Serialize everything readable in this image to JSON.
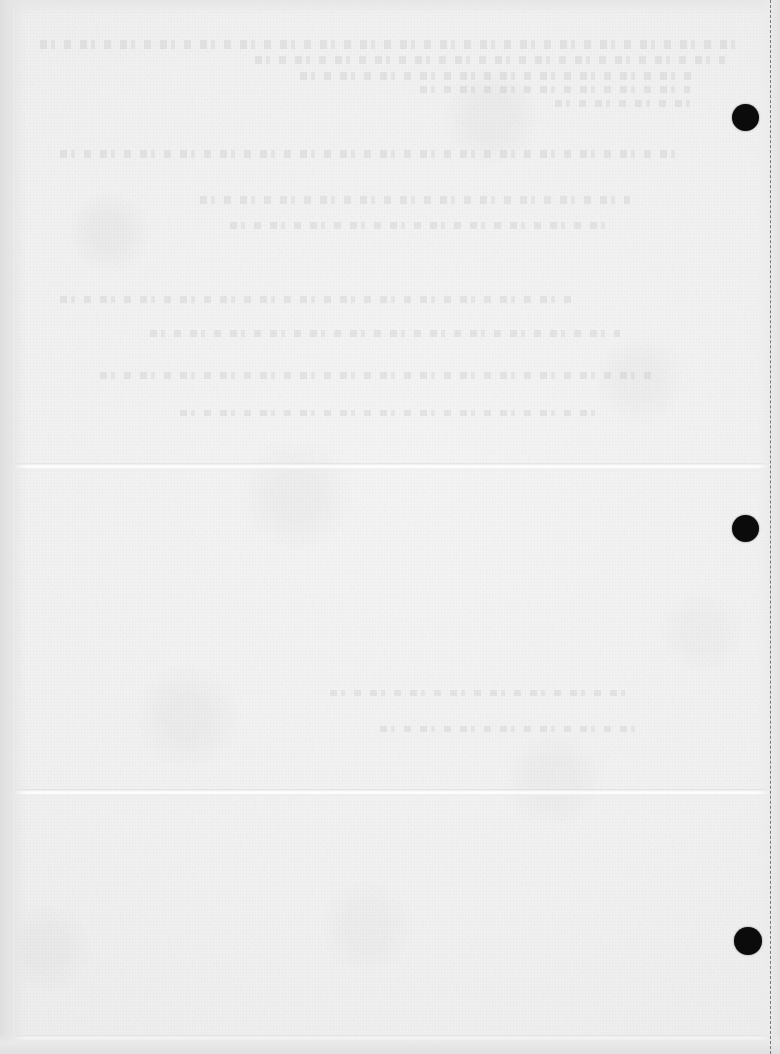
{
  "page": {
    "kind": "scanned-blank-sheet",
    "width": 780,
    "height": 1054,
    "paper_color": "#f1f1f1",
    "ink_color": "#0b0b0b",
    "visible_text": "",
    "note": "No legible text is rendered on this page; only paper texture, faint illegible show-through ghosting, fold creases, punch dots and a dashed guide line are visible."
  },
  "marks": {
    "registration_dots": [
      {
        "name": "registration-dot-top",
        "cx": 745,
        "cy": 117,
        "d": 27,
        "color": "#0b0b0b"
      },
      {
        "name": "registration-dot-middle",
        "cx": 745,
        "cy": 528,
        "d": 27,
        "color": "#0b0b0b"
      },
      {
        "name": "registration-dot-bottom",
        "cx": 748,
        "cy": 941,
        "d": 28,
        "color": "#0b0b0b"
      }
    ],
    "guide_lines": [
      {
        "name": "dashed-right-guide",
        "orientation": "vertical",
        "x": 770,
        "style": "dashed",
        "color": "#78787c"
      }
    ],
    "creases": [
      {
        "name": "crease-upper",
        "orientation": "horizontal",
        "y": 463
      },
      {
        "name": "crease-lower",
        "orientation": "horizontal",
        "y": 789
      },
      {
        "name": "crease-bottom",
        "orientation": "horizontal",
        "y": 1035
      },
      {
        "name": "fold-left",
        "orientation": "vertical",
        "x": 11
      }
    ],
    "ghost_bands": [
      {
        "name": "ghost-text-band-1",
        "x": 40,
        "y": 40,
        "w": 700,
        "h": 9
      },
      {
        "name": "ghost-text-band-2",
        "x": 255,
        "y": 56,
        "w": 470,
        "h": 8
      },
      {
        "name": "ghost-text-band-3",
        "x": 300,
        "y": 72,
        "w": 400,
        "h": 8
      },
      {
        "name": "ghost-text-band-4",
        "x": 420,
        "y": 86,
        "w": 270,
        "h": 7
      },
      {
        "name": "ghost-text-band-5",
        "x": 555,
        "y": 100,
        "w": 140,
        "h": 7
      },
      {
        "name": "ghost-text-band-6",
        "x": 60,
        "y": 150,
        "w": 620,
        "h": 8
      },
      {
        "name": "ghost-text-band-7",
        "x": 200,
        "y": 196,
        "w": 430,
        "h": 8
      },
      {
        "name": "ghost-text-band-8",
        "x": 230,
        "y": 222,
        "w": 380,
        "h": 7
      },
      {
        "name": "ghost-text-band-9",
        "x": 60,
        "y": 296,
        "w": 520,
        "h": 7
      },
      {
        "name": "ghost-text-band-10",
        "x": 150,
        "y": 330,
        "w": 470,
        "h": 7
      },
      {
        "name": "ghost-text-band-11",
        "x": 100,
        "y": 372,
        "w": 560,
        "h": 7
      },
      {
        "name": "ghost-text-band-12",
        "x": 180,
        "y": 410,
        "w": 420,
        "h": 6
      },
      {
        "name": "ghost-text-band-13",
        "x": 330,
        "y": 690,
        "w": 300,
        "h": 6
      },
      {
        "name": "ghost-text-band-14",
        "x": 380,
        "y": 726,
        "w": 260,
        "h": 6
      }
    ]
  }
}
